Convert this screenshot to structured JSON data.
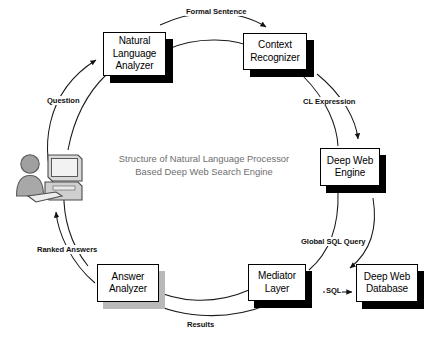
{
  "diagram": {
    "caption": "Structure of Natural Language Processor\nBased Deep Web Search Engine",
    "nodes": [
      {
        "id": "natural-language-analyzer",
        "label": "Natural\nLanguage\nAnalyzer",
        "shadow": "black"
      },
      {
        "id": "context-recognizer",
        "label": "Context\nRecognizer",
        "shadow": "black"
      },
      {
        "id": "deep-web-engine",
        "label": "Deep Web\nEngine",
        "shadow": "black"
      },
      {
        "id": "mediator-layer",
        "label": "Mediator\nLayer",
        "shadow": "black"
      },
      {
        "id": "deep-web-database",
        "label": "Deep Web\nDatabase",
        "shadow": "black"
      },
      {
        "id": "answer-analyzer",
        "label": "Answer\nAnalyzer",
        "shadow": "grey"
      }
    ],
    "edges": [
      {
        "id": "formal-sentence",
        "label": "Formal Sentence",
        "from": "natural-language-analyzer",
        "to": "context-recognizer"
      },
      {
        "id": "cl-expression",
        "label": "CL Expression",
        "from": "context-recognizer",
        "to": "deep-web-engine"
      },
      {
        "id": "global-sql-query",
        "label": "Global SQL Query",
        "from": "deep-web-engine",
        "to": "mediator-layer"
      },
      {
        "id": "sql",
        "label": "SQL",
        "from": "mediator-layer",
        "to": "deep-web-database"
      },
      {
        "id": "results",
        "label": "Results",
        "from": "mediator-layer",
        "to": "answer-analyzer"
      },
      {
        "id": "ranked-answers",
        "label": "Ranked Answers",
        "from": "answer-analyzer",
        "to": "user"
      },
      {
        "id": "question",
        "label": "Question",
        "from": "user",
        "to": "natural-language-analyzer"
      }
    ],
    "actor": {
      "id": "user-at-computer",
      "person_color": "#9c9c9c",
      "computer_color": "#d8d8d8"
    },
    "colors": {
      "box_fill": "#ffffff",
      "box_stroke": "#000000",
      "shadow_black": "#000000",
      "shadow_grey": "#b9b9b9",
      "caption_text": "#6e6e6e",
      "label_text": "#111111"
    }
  }
}
